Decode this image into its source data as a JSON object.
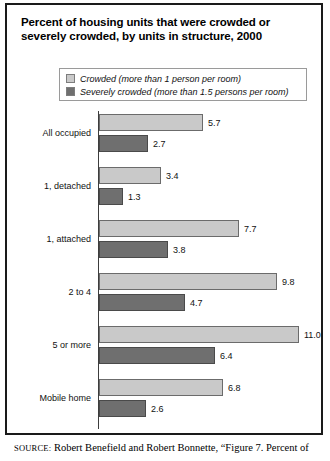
{
  "figure": {
    "title": "Percent of housing units that were crowded or severely crowded, by units in structure, 2000",
    "source_tag": "SOURCE:",
    "source_text": "Robert Benefield and Robert Bonnette, “Figure 7. Percent of"
  },
  "colors": {
    "crowded": "#c9c9c9",
    "severely_crowded": "#6f6f6f",
    "frame": "#1a1a1a",
    "axis": "#3d3d3d"
  },
  "legend": {
    "items": [
      {
        "label": "Crowded (more than 1 person per room)",
        "swatch": "crowded-swatch"
      },
      {
        "label": "Severely crowded (more than 1.5 persons per room)",
        "swatch": "severely-crowded-swatch"
      }
    ]
  },
  "chart_data": {
    "type": "bar",
    "orientation": "horizontal",
    "title": "Percent of housing units that were crowded or severely crowded, by units in structure, 2000",
    "xlabel": "",
    "ylabel": "",
    "xlim": [
      0,
      11.5
    ],
    "grid": false,
    "legend_position": "top",
    "categories": [
      "All occupied",
      "1, detached",
      "1, attached",
      "2 to 4",
      "5 or more",
      "Mobile home"
    ],
    "series": [
      {
        "name": "Crowded (more than 1 person per room)",
        "values": [
          5.7,
          3.4,
          7.7,
          9.8,
          11.0,
          6.8
        ],
        "labels": [
          "5.7",
          "3.4",
          "7.7",
          "9.8",
          "11.0",
          "6.8"
        ]
      },
      {
        "name": "Severely crowded (more than 1.5 persons per room)",
        "values": [
          2.7,
          1.3,
          3.8,
          4.7,
          6.4,
          2.6
        ],
        "labels": [
          "2.7",
          "1.3",
          "3.8",
          "4.7",
          "6.4",
          "2.6"
        ]
      }
    ]
  }
}
